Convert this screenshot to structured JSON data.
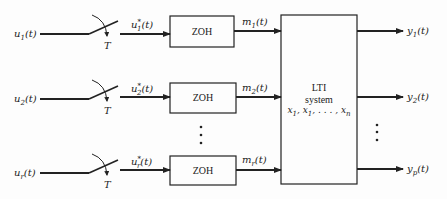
{
  "diagram": {
    "type": "block-diagram",
    "inputs": [
      {
        "name": "u",
        "sub": "1",
        "label_suffix": "(t)",
        "sampled": "u",
        "sampled_sub": "1",
        "held": "m",
        "held_sub": "1"
      },
      {
        "name": "u",
        "sub": "2",
        "label_suffix": "(t)",
        "sampled": "u",
        "sampled_sub": "2",
        "held": "m",
        "held_sub": "2"
      },
      {
        "name": "u",
        "sub": "r",
        "label_suffix": "(t)",
        "sampled": "u",
        "sampled_sub": "r",
        "held": "m",
        "held_sub": "r"
      }
    ],
    "sampler_period_label": "T",
    "sampled_star": "*",
    "zoh_label": "ZOH",
    "system": {
      "line1": "LTI",
      "line2": "system",
      "state_prefix": "x",
      "state_sub1": "1",
      "state_sep1": ", ",
      "state_sub2": "1",
      "state_ellipsis": ", . . . , ",
      "state_subn": "n"
    },
    "outputs": [
      {
        "name": "y",
        "sub": "1",
        "label_suffix": "(t)"
      },
      {
        "name": "y",
        "sub": "2",
        "label_suffix": "(t)"
      },
      {
        "name": "y",
        "sub": "p",
        "label_suffix": "(t)"
      }
    ],
    "colors": {
      "line": "#222222",
      "background": "#fdfdfd"
    }
  }
}
